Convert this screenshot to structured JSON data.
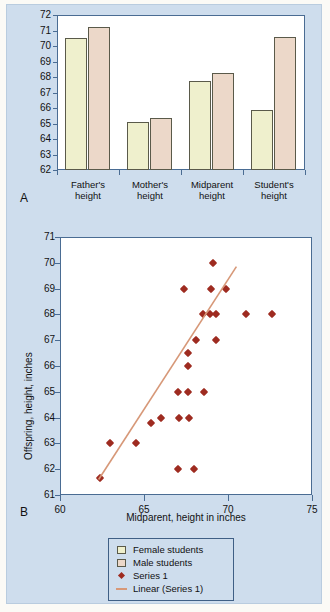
{
  "figure": {
    "panel_a_letter": "A",
    "panel_b_letter": "B",
    "background_color": "#cedded",
    "plot_border_color": "#4a6c93"
  },
  "legend": {
    "items": [
      {
        "label": "Female students",
        "marker": "square-swatch",
        "color": "#eff0cd"
      },
      {
        "label": "Male students",
        "marker": "square-swatch",
        "color": "#ecd8c9"
      },
      {
        "label": "Series 1",
        "marker": "diamond-point",
        "color": "#9e2b20"
      },
      {
        "label": "Linear (Series 1)",
        "marker": "line-segment",
        "color": "#d79878"
      }
    ]
  },
  "chart_data": [
    {
      "type": "bar",
      "panel": "A",
      "title": "",
      "xlabel": "",
      "ylabel": "",
      "ylim": [
        62,
        72
      ],
      "yticks": [
        62,
        63,
        64,
        65,
        66,
        67,
        68,
        69,
        70,
        71,
        72
      ],
      "grid": false,
      "legend_position": "below-figure",
      "categories": [
        "Father's height",
        "Mother's height",
        "Midparent height",
        "Student's height"
      ],
      "series": [
        {
          "name": "Female students",
          "color": "#eff0cd",
          "values": [
            70.5,
            65.1,
            67.75,
            65.85
          ]
        },
        {
          "name": "Male students",
          "color": "#ecd8c9",
          "values": [
            71.2,
            65.35,
            68.25,
            70.6
          ]
        }
      ]
    },
    {
      "type": "scatter",
      "panel": "B",
      "title": "",
      "xlabel": "Midparent, height in inches",
      "ylabel": "Offspring, height, inches",
      "xlim": [
        60,
        75
      ],
      "ylim": [
        61,
        71
      ],
      "xticks": [
        60,
        65,
        70,
        75
      ],
      "yticks": [
        61,
        62,
        63,
        64,
        65,
        66,
        67,
        68,
        69,
        70,
        71
      ],
      "grid": false,
      "marker_color": "#9e2b20",
      "series": [
        {
          "name": "Series 1",
          "points": [
            [
              62.4,
              61.65
            ],
            [
              63.0,
              63.0
            ],
            [
              64.5,
              63.0
            ],
            [
              65.4,
              63.8
            ],
            [
              66.0,
              64.0
            ],
            [
              67.0,
              62.0
            ],
            [
              68.0,
              62.0
            ],
            [
              67.1,
              64.0
            ],
            [
              67.7,
              64.0
            ],
            [
              67.0,
              65.0
            ],
            [
              67.6,
              65.0
            ],
            [
              68.6,
              65.0
            ],
            [
              67.6,
              66.0
            ],
            [
              67.6,
              66.5
            ],
            [
              68.1,
              67.0
            ],
            [
              69.3,
              67.0
            ],
            [
              68.5,
              68.0
            ],
            [
              68.9,
              68.0
            ],
            [
              69.3,
              68.0
            ],
            [
              71.1,
              68.0
            ],
            [
              72.6,
              68.0
            ],
            [
              67.4,
              69.0
            ],
            [
              69.0,
              69.0
            ],
            [
              69.9,
              69.0
            ],
            [
              69.1,
              70.0
            ]
          ]
        }
      ],
      "trendline": {
        "name": "Linear (Series 1)",
        "color": "#d79878",
        "x_start": 62.3,
        "y_start": 61.6,
        "x_end": 70.5,
        "y_end": 69.85
      }
    }
  ]
}
